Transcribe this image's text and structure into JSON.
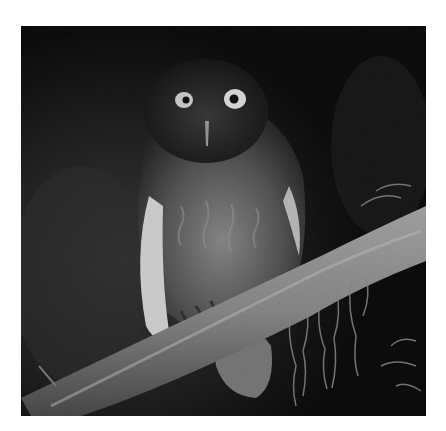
{
  "image": {
    "subject": "owl perched on a mossy branch at night",
    "alt": "Grayscale night photograph of an owl perched on a diagonal mossy branch",
    "colors": {
      "background": "#ffffff",
      "photo_dark": "#0e0e0e",
      "branch": "#8a8a8a",
      "owl_body": "#4a4a4a",
      "eye": "#d8d8d8"
    }
  }
}
